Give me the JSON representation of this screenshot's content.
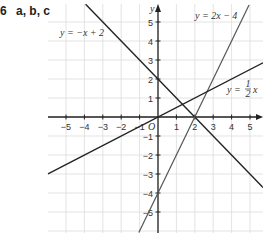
{
  "question": {
    "number": "6",
    "parts": "a, b, c"
  },
  "chart_data": {
    "type": "line",
    "title": "",
    "xlabel": "",
    "ylabel": "y",
    "origin_label": "O",
    "xlim": [
      -6,
      5.8
    ],
    "ylim": [
      -6,
      5.9
    ],
    "x_ticks": [
      -5,
      -4,
      -3,
      -2,
      -1,
      1,
      2,
      3,
      4,
      5
    ],
    "x_tick_labels": [
      "−5",
      "−4",
      "−3",
      "−2",
      "−1",
      "1",
      "2",
      "3",
      "4",
      "5"
    ],
    "y_ticks": [
      5,
      4,
      3,
      2,
      1,
      -1,
      -2,
      -3,
      -4,
      -5
    ],
    "y_tick_labels": [
      "5",
      "4",
      "3",
      "2",
      "1",
      "−1",
      "−2",
      "−3",
      "−4",
      "−5"
    ],
    "grid": true,
    "series": [
      {
        "name": "y = −x + 2",
        "slope": -1,
        "intercept": 2,
        "label": "y = −x + 2"
      },
      {
        "name": "y = 2x − 4",
        "slope": 2,
        "intercept": -4,
        "label": "y = 2x − 4"
      },
      {
        "name": "y = ½x",
        "slope": 0.5,
        "intercept": 0,
        "label_lhs": "y =",
        "label_num": "1",
        "label_den": "2",
        "label_rhs": "x"
      }
    ]
  }
}
